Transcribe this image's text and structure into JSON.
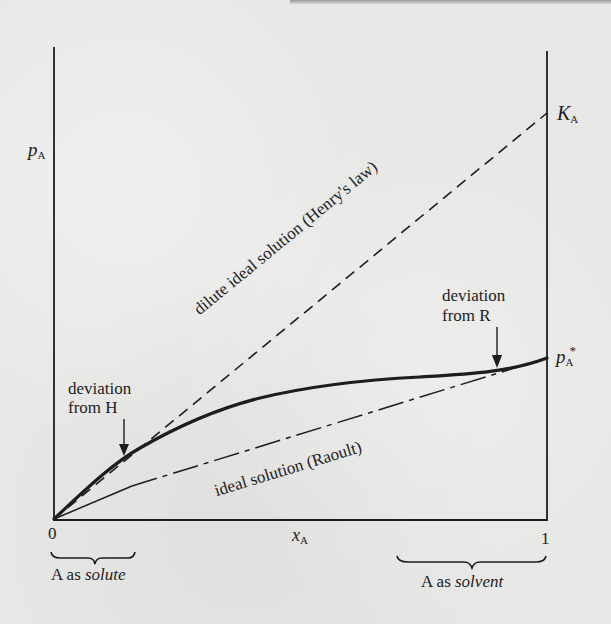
{
  "figure": {
    "y_axis": {
      "symbol": "p",
      "subscript": "A"
    },
    "x_axis": {
      "symbol": "x",
      "subscript": "A",
      "tick_min": "0",
      "tick_max": "1"
    },
    "right_axis_labels": {
      "henry_constant": {
        "symbol": "K",
        "subscript": "A"
      },
      "pure_vapour_pressure": {
        "symbol": "p",
        "subscript": "A",
        "superscript": "*"
      }
    },
    "lines": {
      "henry": {
        "label": "dilute ideal solution (Henry's law)",
        "style": "dashed"
      },
      "raoult": {
        "label": "ideal solution (Raoult)",
        "style": "dash-dot"
      },
      "real": {
        "label": "",
        "style": "solid-thick"
      }
    },
    "annotations": {
      "deviation_h": {
        "line1": "deviation",
        "line2": "from H"
      },
      "deviation_r": {
        "line1": "deviation",
        "line2": "from R"
      }
    },
    "regions": {
      "solute": {
        "prefix": "A as",
        "emph": "solute"
      },
      "solvent": {
        "prefix": "A as",
        "emph": "solvent"
      }
    }
  },
  "colors": {
    "background": "#e7e7e5",
    "ink": "#1d1d1d"
  }
}
